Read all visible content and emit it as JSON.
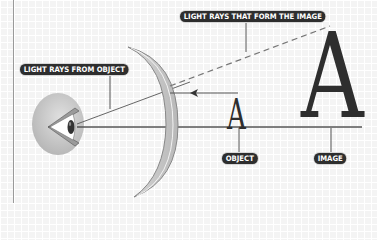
{
  "diagram": {
    "labels": {
      "light_rays_from_object": "LIGHT RAYS FROM OBJECT",
      "light_rays_image": "LIGHT RAYS THAT FORM THE IMAGE",
      "object": "OBJECT",
      "image": "IMAGE"
    },
    "letters": {
      "object_letter": "A",
      "image_letter": "A"
    },
    "colors": {
      "label_bg": "#2e2e2e",
      "label_text": "#ffffff",
      "line": "#555555",
      "mirror_fill": "#c8c8c8",
      "background": "#f4f4f4"
    }
  }
}
